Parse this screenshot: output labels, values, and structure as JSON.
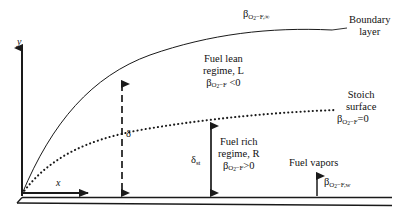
{
  "figure": {
    "type": "diagram",
    "background_color": "#ffffff",
    "line_color": "#1a1a1a",
    "width": 403,
    "height": 222
  },
  "axes": {
    "y_label": "y",
    "x_label": "x"
  },
  "curves": {
    "boundary_layer": {
      "name": "boundary-layer-edge",
      "style": "solid"
    },
    "stoich_surface": {
      "name": "stoichiometric-surface",
      "style": "dotted"
    }
  },
  "labels": {
    "freestream_beta": {
      "symbol": "β",
      "subscript": "O",
      "sub_sub": "2",
      "sub_rest": "−F,∞",
      "full": "βO2−F,∞"
    },
    "boundary_layer": {
      "line1": "Boundary",
      "line2": "layer"
    },
    "fuel_lean": {
      "line1": "Fuel  lean",
      "line2": "regime, L",
      "beta_symbol": "β",
      "beta_sub": "O",
      "beta_sub_sub": "2",
      "beta_sub_rest": "−F",
      "relation": " <0",
      "full": "βO2−F <0"
    },
    "stoich_surface": {
      "line1": "Stoich",
      "line2": "surface",
      "beta_symbol": "β",
      "beta_sub": "O",
      "beta_sub_sub": "2",
      "beta_sub_rest": "−F",
      "relation": "=0",
      "full": "βO2−F=0"
    },
    "fuel_rich": {
      "line1": "Fuel rich",
      "line2": "regime, R",
      "beta_symbol": "β",
      "beta_sub": "O",
      "beta_sub_sub": "2",
      "beta_sub_rest": "−F",
      "relation": ">0",
      "full": "βO2−F>0"
    },
    "fuel_vapors": {
      "text": "Fuel vapors",
      "beta_symbol": "β",
      "beta_sub": "O",
      "beta_sub_sub": "2",
      "beta_sub_rest": "−F,w",
      "full": "βO2−F,w"
    },
    "delta": {
      "symbol": "δ"
    },
    "delta_st": {
      "symbol": "δ",
      "subscript": "st"
    }
  },
  "arrows": {
    "delta_arrow": {
      "name": "boundary-layer-thickness-arrow",
      "style": "dashed",
      "double_headed": true
    },
    "delta_st_arrow": {
      "name": "stoich-height-arrow",
      "style": "solid",
      "double_headed": true
    },
    "fuel_vapor_arrow": {
      "name": "fuel-vapor-flux-arrow",
      "style": "solid",
      "double_headed": false
    },
    "x_axis_arrow": {
      "name": "x-axis-arrow",
      "style": "solid"
    },
    "y_axis_arrow": {
      "name": "y-axis-arrow",
      "style": "solid"
    }
  }
}
